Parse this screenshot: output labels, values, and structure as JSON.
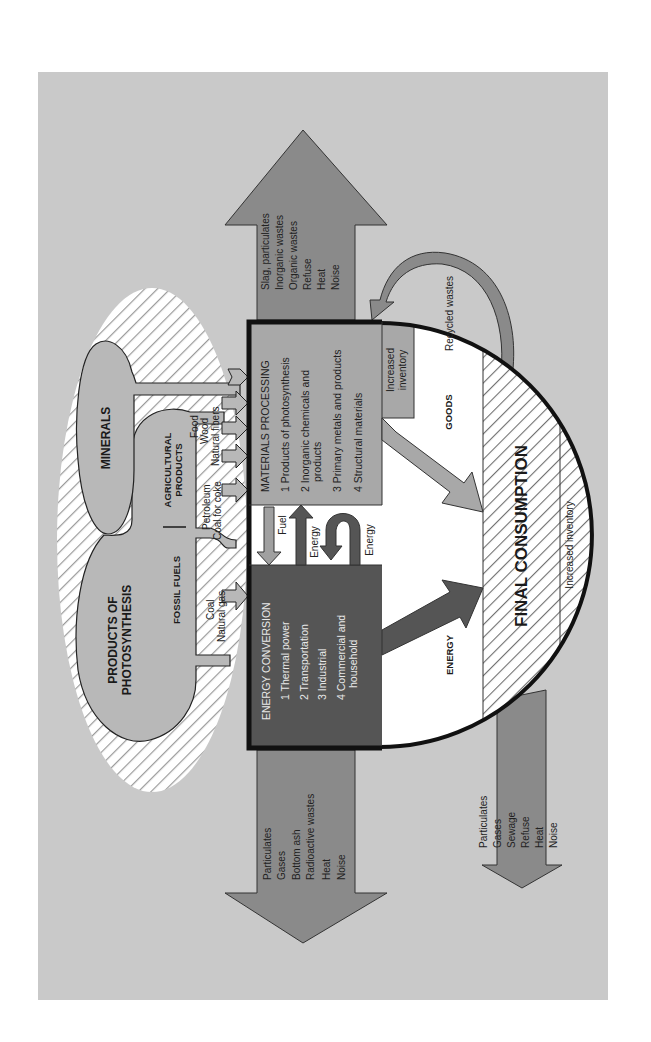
{
  "colors": {
    "page_background": "#ffffff",
    "panel": "#c9c9c9",
    "waste_arrow": "#8a8a8a",
    "energy_box": "#555555",
    "materials_box": "#a8a8a8",
    "outline": "#111111",
    "hatch": "#6e6e6e"
  },
  "sources": {
    "photosynthesis": "PRODUCTS OF PHOTOSYNTHESIS",
    "photosynthesis_line1": "PRODUCTS OF",
    "photosynthesis_line2": "PHOTOSYNTHESIS",
    "minerals": "MINERALS",
    "agricultural_line1": "AGRICULTURAL",
    "agricultural_line2": "PRODUCTS",
    "fossil_fuels": "FOSSIL FUELS",
    "agricultural_items": [
      "Food",
      "Wood",
      "Natural fibers"
    ],
    "fossil_to_materials": [
      "Petroleum",
      "Coal for coke"
    ],
    "fossil_to_energy": [
      "Coal",
      "Natural gas"
    ]
  },
  "materials_processing": {
    "title": "MATERIALS PROCESSING",
    "items": [
      "1 Products of photosynthesis",
      "2 Inorganic chemicals and",
      "products",
      "3 Primary metals and products",
      "4 Structural materials"
    ],
    "inventory_line1": "Increased",
    "inventory_line2": "inventory"
  },
  "energy_conversion": {
    "title": "ENERGY CONVERSION",
    "items": [
      "1 Thermal power",
      "2 Transportation",
      "3 Industrial",
      "4 Commercial and",
      "household"
    ]
  },
  "exchange": {
    "fuel": "Fuel",
    "energy_up": "Energy",
    "energy_loop": "Energy"
  },
  "flows": {
    "goods": "GOODS",
    "energy": "ENERGY",
    "recycled": "Recycled wastes"
  },
  "final_consumption": {
    "title": "FINAL CONSUMPTION",
    "inventory": "Increased inventory"
  },
  "wastes": {
    "materials": [
      "Slag, particulates",
      "Inorganic wastes",
      "Organic wastes",
      "Refuse",
      "Heat",
      "Noise"
    ],
    "energy": [
      "Particulates",
      "Gases",
      "Bottom ash",
      "Radioactive wastes",
      "Heat",
      "Noise"
    ],
    "consumption": [
      "Particulates",
      "Gases",
      "Sewage",
      "Refuse",
      "Heat",
      "Noise"
    ]
  }
}
